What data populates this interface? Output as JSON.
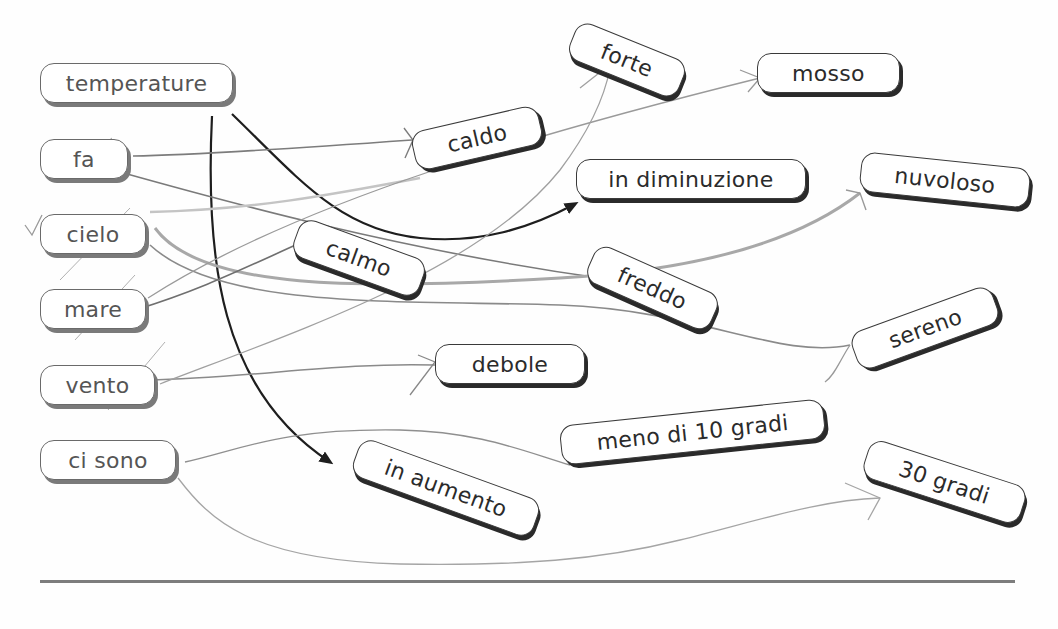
{
  "exercise": {
    "type": "word-matching concept map",
    "left_terms": [
      {
        "id": "temperature",
        "label": "temperature"
      },
      {
        "id": "fa",
        "label": "fa"
      },
      {
        "id": "cielo",
        "label": "cielo"
      },
      {
        "id": "mare",
        "label": "mare"
      },
      {
        "id": "vento",
        "label": "vento"
      },
      {
        "id": "ci_sono",
        "label": "ci sono"
      }
    ],
    "right_terms": [
      {
        "id": "forte",
        "label": "forte"
      },
      {
        "id": "mosso",
        "label": "mosso"
      },
      {
        "id": "caldo",
        "label": "caldo"
      },
      {
        "id": "in_diminuzione",
        "label": "in diminuzione"
      },
      {
        "id": "nuvoloso",
        "label": "nuvoloso"
      },
      {
        "id": "calmo",
        "label": "calmo"
      },
      {
        "id": "freddo",
        "label": "freddo"
      },
      {
        "id": "sereno",
        "label": "sereno"
      },
      {
        "id": "debole",
        "label": "debole"
      },
      {
        "id": "meno_di_10_gradi",
        "label": "meno di 10 gradi"
      },
      {
        "id": "in_aumento",
        "label": "in aumento"
      },
      {
        "id": "30_gradi",
        "label": "30 gradi"
      }
    ],
    "connections": [
      {
        "from": "temperature",
        "to": "in_diminuzione",
        "style": "printed-arrow"
      },
      {
        "from": "temperature",
        "to": "in_aumento",
        "style": "printed-arrow"
      },
      {
        "from": "fa",
        "to": "caldo",
        "style": "hand-drawn"
      },
      {
        "from": "fa",
        "to": "freddo",
        "style": "hand-drawn"
      },
      {
        "from": "cielo",
        "to": "nuvoloso",
        "style": "hand-drawn"
      },
      {
        "from": "cielo",
        "to": "sereno",
        "style": "hand-drawn"
      },
      {
        "from": "mare",
        "to": "calmo",
        "style": "hand-drawn"
      },
      {
        "from": "mare",
        "to": "mosso",
        "style": "hand-drawn"
      },
      {
        "from": "vento",
        "to": "forte",
        "style": "hand-drawn"
      },
      {
        "from": "vento",
        "to": "debole",
        "style": "hand-drawn"
      },
      {
        "from": "ci_sono",
        "to": "meno_di_10_gradi",
        "style": "hand-drawn"
      },
      {
        "from": "ci_sono",
        "to": "30_gradi",
        "style": "hand-drawn"
      }
    ]
  },
  "colors": {
    "printed_arrow": "#1e1e1e",
    "hand_line": "#8a8a8a",
    "hand_line_light": "#b5b5b5",
    "box_border": "#333333",
    "rule": "#7d7d7d"
  }
}
